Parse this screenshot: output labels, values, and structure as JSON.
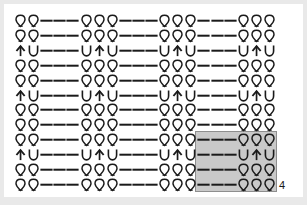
{
  "chart_data": {
    "type": "table",
    "xlabel": "",
    "ylabel": "",
    "columns": 20,
    "rows": 12,
    "legend": [
      {
        "symbol": "q",
        "name": "twisted-knit-stitch",
        "glyph": "Q"
      },
      {
        "symbol": "dash",
        "name": "purl-stitch",
        "glyph": "-"
      },
      {
        "symbol": "u",
        "name": "knit-below-stitch",
        "glyph": "U"
      },
      {
        "symbol": "arrow",
        "name": "raised-increase-stitch",
        "glyph": "↑"
      }
    ],
    "row_patterns": {
      "A": [
        "q",
        "q",
        "dash",
        "dash",
        "dash",
        "q",
        "q",
        "q",
        "dash",
        "dash",
        "dash",
        "q",
        "q",
        "q",
        "dash",
        "dash",
        "dash",
        "q",
        "q",
        "q"
      ],
      "B": [
        "arrow",
        "u",
        "dash",
        "dash",
        "dash",
        "u",
        "arrow",
        "u",
        "dash",
        "dash",
        "dash",
        "u",
        "arrow",
        "u",
        "dash",
        "dash",
        "dash",
        "u",
        "arrow",
        "u"
      ]
    },
    "grid": [
      [
        "q",
        "q",
        "dash",
        "dash",
        "dash",
        "q",
        "q",
        "q",
        "dash",
        "dash",
        "dash",
        "q",
        "q",
        "q",
        "dash",
        "dash",
        "dash",
        "q",
        "q",
        "q"
      ],
      [
        "q",
        "q",
        "dash",
        "dash",
        "dash",
        "q",
        "q",
        "q",
        "dash",
        "dash",
        "dash",
        "q",
        "q",
        "q",
        "dash",
        "dash",
        "dash",
        "q",
        "q",
        "q"
      ],
      [
        "arrow",
        "u",
        "dash",
        "dash",
        "dash",
        "u",
        "arrow",
        "u",
        "dash",
        "dash",
        "dash",
        "u",
        "arrow",
        "u",
        "dash",
        "dash",
        "dash",
        "u",
        "arrow",
        "u"
      ],
      [
        "q",
        "q",
        "dash",
        "dash",
        "dash",
        "q",
        "q",
        "q",
        "dash",
        "dash",
        "dash",
        "q",
        "q",
        "q",
        "dash",
        "dash",
        "dash",
        "q",
        "q",
        "q"
      ],
      [
        "q",
        "q",
        "dash",
        "dash",
        "dash",
        "q",
        "q",
        "q",
        "dash",
        "dash",
        "dash",
        "q",
        "q",
        "q",
        "dash",
        "dash",
        "dash",
        "q",
        "q",
        "q"
      ],
      [
        "arrow",
        "u",
        "dash",
        "dash",
        "dash",
        "u",
        "arrow",
        "u",
        "dash",
        "dash",
        "dash",
        "u",
        "arrow",
        "u",
        "dash",
        "dash",
        "dash",
        "u",
        "arrow",
        "u"
      ],
      [
        "q",
        "q",
        "dash",
        "dash",
        "dash",
        "q",
        "q",
        "q",
        "dash",
        "dash",
        "dash",
        "q",
        "q",
        "q",
        "dash",
        "dash",
        "dash",
        "q",
        "q",
        "q"
      ],
      [
        "q",
        "q",
        "dash",
        "dash",
        "dash",
        "q",
        "q",
        "q",
        "dash",
        "dash",
        "dash",
        "q",
        "q",
        "q",
        "dash",
        "dash",
        "dash",
        "q",
        "q",
        "q"
      ],
      [
        "q",
        "q",
        "dash",
        "dash",
        "dash",
        "q",
        "q",
        "q",
        "dash",
        "dash",
        "dash",
        "q",
        "q",
        "q",
        "dash",
        "dash",
        "dash",
        "q",
        "q",
        "q"
      ],
      [
        "arrow",
        "u",
        "dash",
        "dash",
        "dash",
        "u",
        "arrow",
        "u",
        "dash",
        "dash",
        "dash",
        "u",
        "arrow",
        "u",
        "dash",
        "dash",
        "dash",
        "u",
        "arrow",
        "u"
      ],
      [
        "q",
        "q",
        "dash",
        "dash",
        "dash",
        "q",
        "q",
        "q",
        "dash",
        "dash",
        "dash",
        "q",
        "q",
        "q",
        "dash",
        "dash",
        "dash",
        "q",
        "q",
        "q"
      ],
      [
        "q",
        "q",
        "dash",
        "dash",
        "dash",
        "q",
        "q",
        "q",
        "dash",
        "dash",
        "dash",
        "q",
        "q",
        "q",
        "dash",
        "dash",
        "dash",
        "q",
        "q",
        "q"
      ]
    ],
    "repeat_box": {
      "start_col": 14,
      "end_col": 19,
      "start_row": 8,
      "end_row": 11,
      "row_count_label": "4",
      "col_count_label": "6",
      "fill_color": "#c9c9c9",
      "border_color": "#8e8e8e"
    },
    "colors": {
      "symbol": "#1a1a1a",
      "background": "#ffffff",
      "page_background": "#e9e9e9"
    }
  }
}
